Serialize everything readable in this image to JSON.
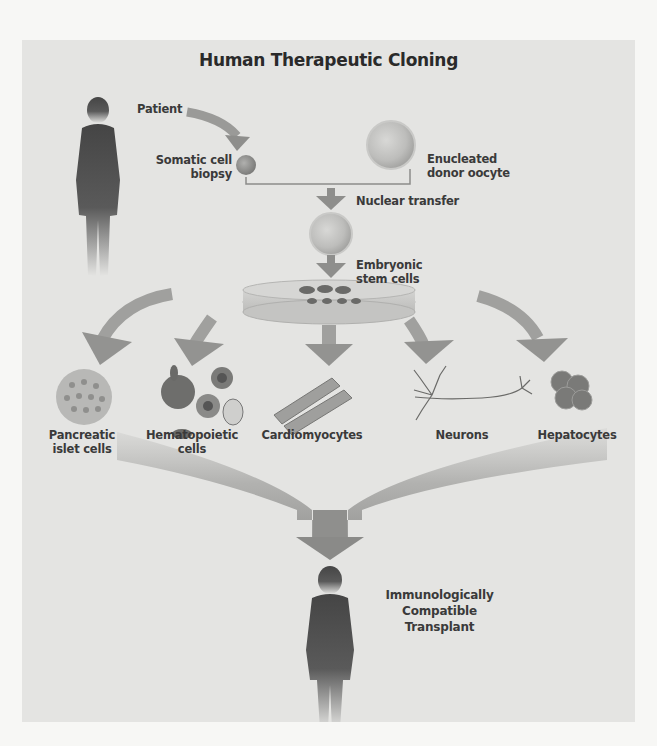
{
  "diagram": {
    "title": "Human Therapeutic Cloning",
    "labels": {
      "patient": "Patient",
      "somatic_cell_1": "Somatic cell",
      "somatic_cell_2": "biopsy",
      "oocyte_1": "Enucleated",
      "oocyte_2": "donor oocyte",
      "nuclear_transfer": "Nuclear transfer",
      "stem_cells_1": "Embryonic",
      "stem_cells_2": "stem cells",
      "transplant_1": "Immunologically",
      "transplant_2": "Compatible",
      "transplant_3": "Transplant"
    },
    "cell_types": [
      {
        "line1": "Pancreatic",
        "line2": "islet cells"
      },
      {
        "line1": "Hematopoietic",
        "line2": "cells"
      },
      {
        "line1": "Cardiomyocytes",
        "line2": ""
      },
      {
        "line1": "Neurons",
        "line2": ""
      },
      {
        "line1": "Hepatocytes",
        "line2": ""
      }
    ],
    "colors": {
      "panel_bg": "#e4e4e2",
      "page_bg": "#f7f7f5",
      "arrow": "#8a8a8a",
      "silhouette": "#4a4a4a",
      "text": "#3a3a3a"
    }
  }
}
